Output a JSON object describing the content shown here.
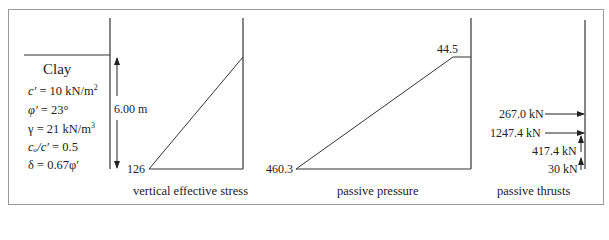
{
  "soil": {
    "name": "Clay",
    "properties": [
      {
        "lhs": "c′",
        "rhs": " = 10 kN/m",
        "sup": "2"
      },
      {
        "lhs": "φ′",
        "rhs": " = 23°",
        "sup": ""
      },
      {
        "lhs": "γ",
        "rhs": " = 21 kN/m",
        "sup": "3"
      },
      {
        "lhs": "cᵤ/c′",
        "rhs": " = 0.5",
        "sup": ""
      },
      {
        "lhs": "δ",
        "rhs": "  = 0.67φ′",
        "sup": ""
      }
    ]
  },
  "wall": {
    "height_label": "6.00 m"
  },
  "diagrams": {
    "vertical_effective_stress": {
      "caption": "vertical effective stress",
      "base_value": "126"
    },
    "passive_pressure": {
      "caption": "passive pressure",
      "base_value": "460.3",
      "top_value": "44.5"
    },
    "passive_thrusts": {
      "caption": "passive thrusts",
      "forces": [
        {
          "label": "267.0 kN",
          "direction": "horizontal"
        },
        {
          "label": "1247.4 kN",
          "direction": "horizontal"
        },
        {
          "label": "417.4 kN",
          "direction": "vertical"
        },
        {
          "label": "30 kN",
          "direction": "vertical"
        }
      ]
    }
  },
  "colors": {
    "line": "#333333",
    "frame": "#888888"
  }
}
